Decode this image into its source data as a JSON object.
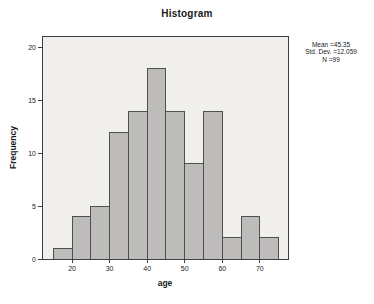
{
  "chart_data": {
    "type": "bar",
    "title": "Histogram",
    "xlabel": "age",
    "ylabel": "Frequency",
    "bin_edges": [
      15,
      20,
      25,
      30,
      35,
      40,
      45,
      50,
      55,
      60,
      65,
      70,
      75
    ],
    "values": [
      1,
      4,
      5,
      12,
      14,
      18,
      14,
      9,
      14,
      2,
      4,
      2
    ],
    "x_ticks": [
      20,
      30,
      40,
      50,
      60,
      70
    ],
    "y_ticks": [
      0,
      5,
      10,
      15,
      20
    ],
    "xlim": [
      12,
      77.5
    ],
    "ylim": [
      0,
      21.1
    ],
    "grid": false,
    "legend": false,
    "annotation": {
      "lines": [
        "Mean =45.35",
        "Std. Dev. =12.059",
        "N =99"
      ]
    },
    "colors": {
      "background": "#ffffff",
      "plot_bg": "#f1efec",
      "bar_fill": "#bdbcba",
      "bar_stroke": "#4f4f4f",
      "frame": "#404040",
      "text": "#1a1a1a"
    }
  }
}
